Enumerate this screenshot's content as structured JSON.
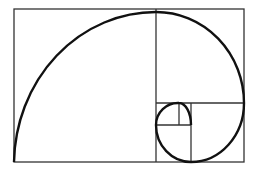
{
  "diagram": {
    "stroke_color": "#1a1a1a",
    "background": "#ffffff",
    "outer_rect": {
      "x": 14,
      "y": 9,
      "w": 230,
      "h": 153
    },
    "divisions": [
      {
        "x1": 156,
        "y1": 9,
        "x2": 156,
        "y2": 162
      },
      {
        "x1": 156,
        "y1": 103,
        "x2": 244,
        "y2": 103
      },
      {
        "x1": 191,
        "y1": 103,
        "x2": 191,
        "y2": 162
      },
      {
        "x1": 156,
        "y1": 125,
        "x2": 191,
        "y2": 125
      },
      {
        "x1": 179,
        "y1": 103,
        "x2": 179,
        "y2": 125
      }
    ]
  }
}
